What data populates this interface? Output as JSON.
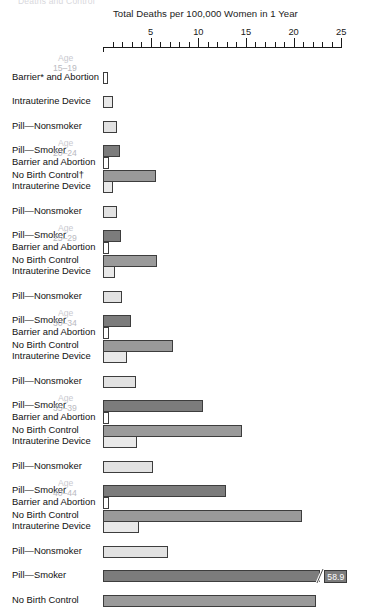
{
  "cut_off_heading": "Deaths and Control",
  "axis": {
    "title": "Total Deaths per 100,000 Women in 1 Year",
    "labels": [
      "5",
      "10",
      "15",
      "20",
      "25"
    ],
    "min": 0,
    "max": 25,
    "major_step": 5,
    "minor_step": 1
  },
  "age_word": "Age",
  "chart_data": {
    "type": "bar",
    "title": "Total Deaths per 100,000 Women in 1 Year",
    "xlabel": "Total Deaths per 100,000 Women in 1 Year",
    "ylabel": "",
    "xlim": [
      0,
      25
    ],
    "grid": false,
    "legend": "none",
    "orientation": "horizontal",
    "categories": [
      "Barrier and Abortion",
      "Intrauterine Device",
      "Pill—Nonsmoker",
      "Pill—Smoker",
      "No Birth Control"
    ],
    "series": [
      {
        "name": "Age 15–19",
        "values": [
          0.5,
          1.0,
          1.5,
          1.8,
          5.6
        ]
      },
      {
        "name": "Age 20–24",
        "values": [
          0.6,
          1.1,
          1.5,
          1.9,
          5.7
        ]
      },
      {
        "name": "Age 25–29",
        "values": [
          0.6,
          1.3,
          2.0,
          2.9,
          7.3
        ]
      },
      {
        "name": "Age 30–34",
        "values": [
          0.6,
          2.5,
          3.5,
          10.5,
          14.6
        ]
      },
      {
        "name": "Age 35–39",
        "values": [
          0.6,
          3.6,
          5.2,
          12.9,
          20.9
        ]
      },
      {
        "name": "Age 40–44",
        "values": [
          0.6,
          3.8,
          6.8,
          58.9,
          22.4
        ]
      }
    ],
    "annotations": [
      {
        "series": "Age 40–44",
        "category": "Pill—Smoker",
        "text": "58.9",
        "note": "bar broken, value label shown"
      }
    ]
  },
  "groups": [
    {
      "age_word": "Age",
      "age_range": "15–19",
      "rows": [
        {
          "label": "Barrier* and Abortion",
          "value": 0.5,
          "shade": "c0"
        },
        {
          "label": "Intrauterine Device",
          "value": 1.0,
          "shade": "c1"
        },
        {
          "label": "Pill—Nonsmoker",
          "value": 1.5,
          "shade": "c2"
        },
        {
          "label": "Pill—Smoker",
          "value": 1.8,
          "shade": "c3"
        },
        {
          "label": "No Birth Control†",
          "value": 5.6,
          "shade": "c4"
        }
      ]
    },
    {
      "age_word": "Age",
      "age_range": "20–24",
      "rows": [
        {
          "label": "Barrier and Abortion",
          "value": 0.6,
          "shade": "c0"
        },
        {
          "label": "Intrauterine Device",
          "value": 1.1,
          "shade": "c1"
        },
        {
          "label": "Pill—Nonsmoker",
          "value": 1.5,
          "shade": "c2"
        },
        {
          "label": "Pill—Smoker",
          "value": 1.9,
          "shade": "c3"
        },
        {
          "label": "No Birth Control",
          "value": 5.7,
          "shade": "c4"
        }
      ]
    },
    {
      "age_word": "Age",
      "age_range": "25–29",
      "rows": [
        {
          "label": "Barrier and Abortion",
          "value": 0.6,
          "shade": "c0"
        },
        {
          "label": "Intrauterine Device",
          "value": 1.3,
          "shade": "c1"
        },
        {
          "label": "Pill—Nonsmoker",
          "value": 2.0,
          "shade": "c2"
        },
        {
          "label": "Pill—Smoker",
          "value": 2.9,
          "shade": "c3"
        },
        {
          "label": "No Birth Control",
          "value": 7.3,
          "shade": "c4"
        }
      ]
    },
    {
      "age_word": "Age",
      "age_range": "30–34",
      "rows": [
        {
          "label": "Barrier and Abortion",
          "value": 0.6,
          "shade": "c0"
        },
        {
          "label": "Intrauterine Device",
          "value": 2.5,
          "shade": "c1"
        },
        {
          "label": "Pill—Nonsmoker",
          "value": 3.5,
          "shade": "c2"
        },
        {
          "label": "Pill—Smoker",
          "value": 10.5,
          "shade": "c3"
        },
        {
          "label": "No Birth Control",
          "value": 14.6,
          "shade": "c4"
        }
      ]
    },
    {
      "age_word": "Age",
      "age_range": "35–39",
      "rows": [
        {
          "label": "Barrier and Abortion",
          "value": 0.6,
          "shade": "c0"
        },
        {
          "label": "Intrauterine Device",
          "value": 3.6,
          "shade": "c1"
        },
        {
          "label": "Pill—Nonsmoker",
          "value": 5.2,
          "shade": "c2"
        },
        {
          "label": "Pill—Smoker",
          "value": 12.9,
          "shade": "c3"
        },
        {
          "label": "No Birth Control",
          "value": 20.9,
          "shade": "c4"
        }
      ]
    },
    {
      "age_word": "Age",
      "age_range": "40–44",
      "rows": [
        {
          "label": "Barrier and Abortion",
          "value": 0.6,
          "shade": "c0"
        },
        {
          "label": "Intrauterine Device",
          "value": 3.8,
          "shade": "c1"
        },
        {
          "label": "Pill—Nonsmoker",
          "value": 6.8,
          "shade": "c2"
        },
        {
          "label": "Pill—Smoker",
          "value": 58.9,
          "shade": "c3",
          "broken": true,
          "value_label": "58.9",
          "draw_to": 22.8
        },
        {
          "label": "No Birth Control",
          "value": 22.4,
          "shade": "c4"
        }
      ]
    }
  ]
}
